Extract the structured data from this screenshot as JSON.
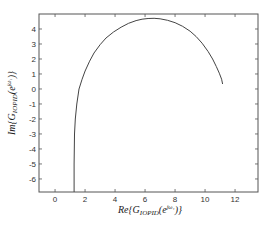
{
  "chart_data": {
    "type": "line",
    "title": "",
    "xlabel": "Re{G_IOPID(e^{jω₁})}",
    "ylabel": "Im{G_IOPID(e^{jω₁})}",
    "xlabel_parts": {
      "pre": "Re{G",
      "sub": "IOPID",
      "mid": "(e",
      "sup": "jω₁",
      "post": ")}"
    },
    "ylabel_parts": {
      "pre": "Im{G",
      "sub": "IOPID",
      "mid": "(e",
      "sup": "jω₁",
      "post": ")}"
    },
    "xlim": [
      -1.07,
      13.53
    ],
    "ylim": [
      -6.87,
      5.0
    ],
    "xticks": [
      0,
      2,
      4,
      6,
      8,
      10,
      12
    ],
    "yticks": [
      4,
      3,
      2,
      1,
      0,
      -1,
      -2,
      -3,
      -4,
      -5,
      -6
    ],
    "grid": false,
    "legend": null,
    "series": [
      {
        "name": "Nyquist curve",
        "color": "#444444",
        "x": [
          1.27,
          1.27,
          1.28,
          1.3,
          1.35,
          1.45,
          1.6,
          1.8,
          2.0,
          2.3,
          2.6,
          3.0,
          3.4,
          3.9,
          4.4,
          4.9,
          5.4,
          5.8,
          6.2,
          6.6,
          7.0,
          7.5,
          8.0,
          8.5,
          9.0,
          9.4,
          9.8,
          10.2,
          10.5,
          10.75,
          10.95,
          11.1,
          11.17
        ],
        "y": [
          -6.87,
          -5.0,
          -4.0,
          -3.0,
          -2.0,
          -1.0,
          0.0,
          0.65,
          1.2,
          1.85,
          2.4,
          2.95,
          3.4,
          3.8,
          4.12,
          4.38,
          4.56,
          4.65,
          4.7,
          4.71,
          4.68,
          4.58,
          4.42,
          4.18,
          3.85,
          3.5,
          3.05,
          2.5,
          2.0,
          1.5,
          1.05,
          0.65,
          0.33
        ]
      }
    ]
  }
}
